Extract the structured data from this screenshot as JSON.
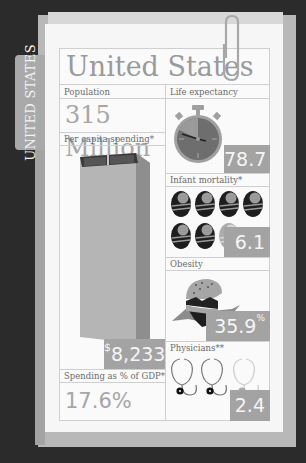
{
  "folder": {
    "tab_label": "UNITED STATES"
  },
  "card": {
    "title": "United States",
    "population": {
      "label": "Population",
      "value": "315 Million"
    },
    "per_capita_spending": {
      "label": "Per capita spending*",
      "currency_symbol": "$",
      "value": "8,233"
    },
    "spending_gdp": {
      "label": "Spending as % of GDP*",
      "value": "17.6%"
    },
    "life_expectancy": {
      "label": "Life expectancy",
      "value": "78.7"
    },
    "infant_mortality": {
      "label": "Infant mortality*",
      "value": "6.1"
    },
    "obesity": {
      "label": "Obesity",
      "value": "35.9",
      "unit": "%"
    },
    "physicians": {
      "label": "Physicians**",
      "value": "2.4"
    }
  },
  "colors": {
    "background": "#2b2b2b",
    "paper": "#f6f6f6",
    "accent_box": "#a3a3a3",
    "text_gray": "#9a9a9a"
  },
  "icons": [
    "paperclip-icon",
    "money-stack-icon",
    "stopwatch-icon",
    "baby-icon",
    "burger-icon",
    "stethoscope-icon"
  ]
}
